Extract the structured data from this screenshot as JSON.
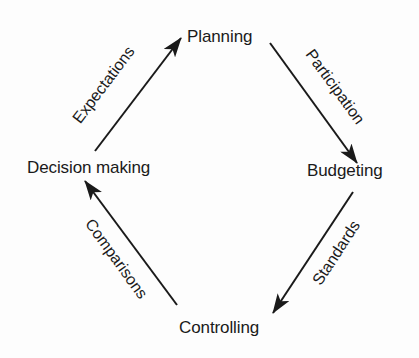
{
  "diagram": {
    "type": "cycle",
    "nodes": [
      {
        "id": "planning",
        "label": "Planning"
      },
      {
        "id": "budgeting",
        "label": "Budgeting"
      },
      {
        "id": "controlling",
        "label": "Controlling"
      },
      {
        "id": "decision_making",
        "label": "Decision making"
      }
    ],
    "edges": [
      {
        "from": "planning",
        "to": "budgeting",
        "label": "Participation"
      },
      {
        "from": "budgeting",
        "to": "controlling",
        "label": "Standards"
      },
      {
        "from": "controlling",
        "to": "decision_making",
        "label": "Comparisons"
      },
      {
        "from": "decision_making",
        "to": "planning",
        "label": "Expectations"
      }
    ],
    "colors": {
      "stroke": "#1a1a1a",
      "background": "#fdfdfd"
    }
  }
}
